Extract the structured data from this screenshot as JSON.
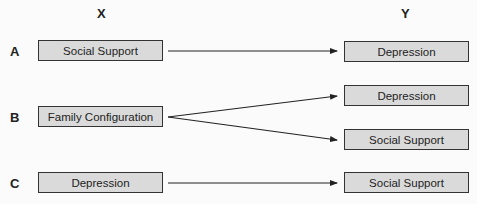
{
  "columns": {
    "x_label": "X",
    "y_label": "Y"
  },
  "rows": [
    {
      "label": "A",
      "source": "Social Support",
      "targets": [
        "Depression"
      ]
    },
    {
      "label": "B",
      "source": "Family Configuration",
      "targets": [
        "Depression",
        "Social Support"
      ]
    },
    {
      "label": "C",
      "source": "Depression",
      "targets": [
        "Social Support"
      ]
    }
  ],
  "colors": {
    "box_fill": "#dadada",
    "box_border": "#333333",
    "arrow": "#222222",
    "background": "#fbfbfb"
  }
}
